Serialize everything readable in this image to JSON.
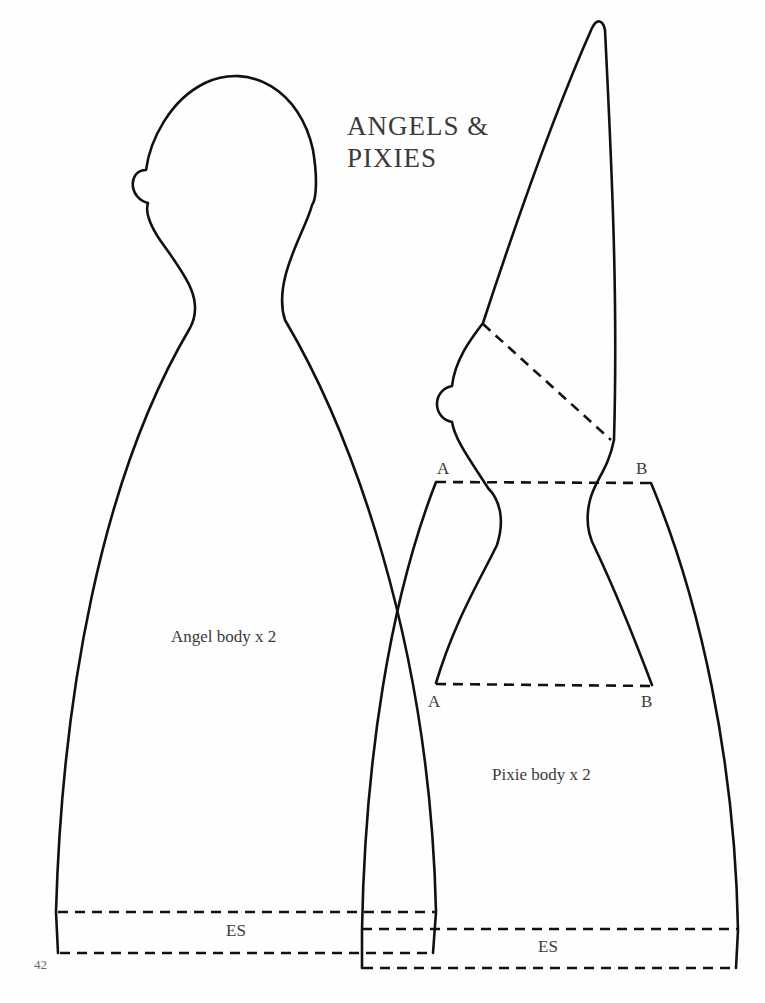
{
  "page": {
    "title_line1": "ANGELS &",
    "title_line2": "PIXIES",
    "page_number": "42"
  },
  "angel": {
    "label": "Angel body x 2",
    "hem_label": "ES"
  },
  "pixie": {
    "label": "Pixie body x 2",
    "hem_label": "ES",
    "markers": {
      "top_left": "A",
      "top_right": "B",
      "bottom_left": "A",
      "bottom_right": "B"
    }
  },
  "colors": {
    "line": "#111111",
    "text": "#3a3a3a",
    "background": "#fefefe"
  }
}
